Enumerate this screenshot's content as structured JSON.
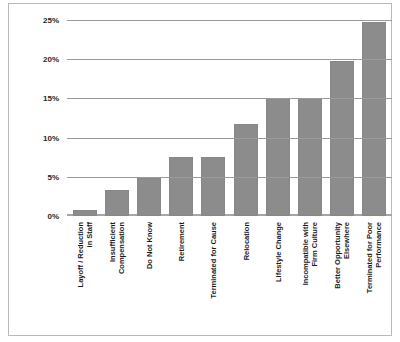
{
  "chart_data": {
    "type": "bar",
    "title": "",
    "subtitle": "",
    "xlabel": "",
    "ylabel": "",
    "ylim": [
      0,
      25
    ],
    "grid": true,
    "legend": "none",
    "orientation": "vertical",
    "bar_color": "#8c8c8c",
    "categories": [
      "Layoff / Reduction in Staff",
      "Insufficient Compensation",
      "Do Not Know",
      "Retirement",
      "Terminated for Cause",
      "Relocation",
      "Lifestyle Change",
      "Incompatible with Firm Culture",
      "Better Opportunity Elsewhere",
      "Terminated for Poor Performance"
    ],
    "category_lines": [
      [
        "Layoff / Reduction",
        "in Staff"
      ],
      [
        "Insufficient",
        "Compensation"
      ],
      [
        "Do Not Know"
      ],
      [
        "Retirement"
      ],
      [
        "Terminated for Cause"
      ],
      [
        "Relocation"
      ],
      [
        "Lifestyle Change"
      ],
      [
        "Incompatible with",
        "Firm Culture"
      ],
      [
        "Better Opportunity",
        "Elsewhere"
      ],
      [
        "Terminated for Poor",
        "Performance"
      ]
    ],
    "values": [
      0.8,
      3.3,
      4.9,
      7.5,
      7.5,
      11.7,
      15.0,
      15.0,
      19.8,
      24.7
    ],
    "value_labels": [
      "0.8%",
      "3.3%",
      "4.9%",
      "7.5%",
      "7.5%",
      "11.7%",
      "15.0%",
      "15.0%",
      "19.8%",
      "24.7%"
    ],
    "yticks": [
      0,
      5,
      10,
      15,
      20,
      25
    ],
    "ytick_labels": [
      "0%",
      "5%",
      "10%",
      "15%",
      "20%",
      "25%"
    ]
  }
}
